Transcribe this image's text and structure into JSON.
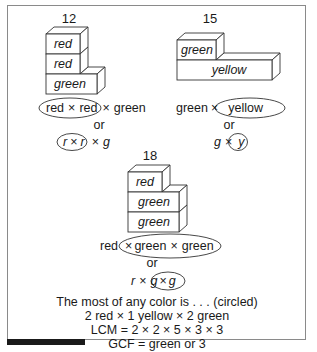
{
  "figure": {
    "groups": [
      {
        "number": "12",
        "blocks": [
          "red",
          "red",
          "green"
        ],
        "expr_words": {
          "a": "red",
          "op1": "×",
          "b": "red",
          "op2": "×",
          "c": "green",
          "circled": "red × red"
        },
        "or": "or",
        "expr_letters": {
          "a": "r",
          "op1": "×",
          "b": "r",
          "op2": "×",
          "c": "g"
        }
      },
      {
        "number": "15",
        "blocks": [
          "green",
          "yellow"
        ],
        "expr_words": {
          "a": "green",
          "op1": "×",
          "b": "yellow",
          "circled": "yellow"
        },
        "or": "or",
        "expr_letters": {
          "a": "g",
          "op1": "×",
          "b": "y"
        }
      },
      {
        "number": "18",
        "blocks": [
          "red",
          "green",
          "green"
        ],
        "expr_words": {
          "a": "red",
          "op1": "×",
          "b": "green",
          "op2": "×",
          "c": "green",
          "circled": "green × green"
        },
        "or": "or",
        "expr_letters": {
          "a": "r",
          "op1": "×",
          "b": "g",
          "op2": "×",
          "c": "g"
        }
      }
    ],
    "summary": [
      "The most of any color is . . . (circled)",
      "2 red × 1 yellow × 2 green",
      "LCM = 2 × 2 × 5 × 3 × 3",
      "GCF = green or 3"
    ]
  },
  "colors": {
    "line": "#333333",
    "frame": "#8a8a8a",
    "bar": "#1a1a1a"
  }
}
